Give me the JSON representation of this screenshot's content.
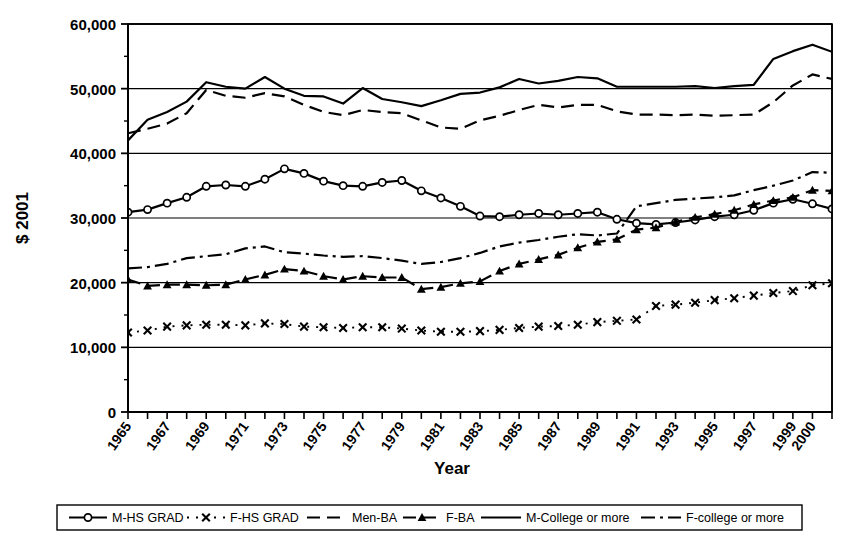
{
  "chart_data": {
    "type": "line",
    "title": "",
    "xlabel": "Year",
    "ylabel": "$ 2001",
    "ylim": [
      0,
      60000
    ],
    "xlim": [
      1965,
      2001
    ],
    "grid": true,
    "legend_position": "bottom",
    "ytick_labels": [
      "0",
      "10,000",
      "20,000",
      "30,000",
      "40,000",
      "50,000",
      "60,000"
    ],
    "ytick_values": [
      0,
      10000,
      20000,
      30000,
      40000,
      50000,
      60000
    ],
    "x": [
      1965,
      1966,
      1967,
      1968,
      1969,
      1970,
      1971,
      1972,
      1973,
      1974,
      1975,
      1976,
      1977,
      1978,
      1979,
      1980,
      1981,
      1982,
      1983,
      1984,
      1985,
      1986,
      1987,
      1988,
      1989,
      1990,
      1991,
      1992,
      1993,
      1994,
      1995,
      1996,
      1997,
      1998,
      1999,
      2000,
      2001
    ],
    "xtick_labels": [
      "1965",
      "",
      "1967",
      "",
      "1969",
      "",
      "1971",
      "",
      "1973",
      "",
      "1975",
      "",
      "1977",
      "",
      "1979",
      "",
      "1981",
      "",
      "1983",
      "",
      "1985",
      "",
      "1987",
      "",
      "1989",
      "",
      "1991",
      "",
      "1993",
      "",
      "1995",
      "",
      "1997",
      "",
      "1999",
      "2000",
      ""
    ],
    "series": [
      {
        "name": "M-HS GRAD",
        "marker": "circle-open",
        "dash": "solid",
        "values": [
          30900,
          31300,
          32300,
          33200,
          34900,
          35100,
          34900,
          36000,
          37600,
          36900,
          35700,
          35000,
          34900,
          35500,
          35800,
          34200,
          33100,
          31800,
          30300,
          30200,
          30500,
          30700,
          30500,
          30700,
          30900,
          29800,
          29200,
          29000,
          29300,
          29700,
          30200,
          30500,
          31200,
          32300,
          32900,
          32200,
          31400
        ]
      },
      {
        "name": "F-HS GRAD",
        "marker": "x",
        "dash": "dotted",
        "values": [
          12300,
          12600,
          13200,
          13400,
          13500,
          13500,
          13400,
          13700,
          13600,
          13200,
          13100,
          13000,
          13100,
          13100,
          12900,
          12600,
          12400,
          12400,
          12500,
          12700,
          13000,
          13200,
          13300,
          13500,
          13900,
          14100,
          14300,
          16400,
          16600,
          16900,
          17300,
          17600,
          18000,
          18400,
          18700,
          19600,
          19900
        ]
      },
      {
        "name": "Men-BA",
        "marker": "none",
        "dash": "dashed",
        "values": [
          43100,
          43800,
          44600,
          46200,
          49800,
          48900,
          48600,
          49300,
          48800,
          47500,
          46400,
          45900,
          46700,
          46400,
          46200,
          45100,
          44000,
          43800,
          45100,
          45800,
          46700,
          47500,
          47100,
          47500,
          47500,
          46500,
          46000,
          46000,
          45900,
          46000,
          45800,
          45900,
          46000,
          47900,
          50500,
          52200,
          51500
        ]
      },
      {
        "name": "F-BA",
        "marker": "triangle",
        "dash": "dashed",
        "values": [
          20500,
          19500,
          19700,
          19700,
          19600,
          19700,
          20500,
          21200,
          22100,
          21800,
          21000,
          20500,
          21000,
          20800,
          20800,
          19000,
          19300,
          19900,
          20200,
          21800,
          22900,
          23600,
          24300,
          25400,
          26300,
          26700,
          28200,
          28500,
          29400,
          30100,
          30600,
          31200,
          32100,
          32700,
          33200,
          34300,
          34200
        ]
      },
      {
        "name": "M-College or more",
        "marker": "none",
        "dash": "solid",
        "values": [
          42000,
          45200,
          46400,
          48000,
          51000,
          50300,
          50000,
          51800,
          50000,
          48900,
          48800,
          47700,
          50100,
          48400,
          47900,
          47300,
          48200,
          49200,
          49400,
          50200,
          51500,
          50800,
          51200,
          51800,
          51600,
          50300,
          50300,
          50300,
          50300,
          50400,
          50100,
          50400,
          50600,
          54600,
          55800,
          56800,
          55700
        ]
      },
      {
        "name": "F-college or more",
        "marker": "none",
        "dash": "dash-dot",
        "values": [
          22200,
          22400,
          22900,
          23800,
          24100,
          24400,
          25300,
          25600,
          24700,
          24500,
          24200,
          24000,
          24100,
          23800,
          23400,
          22900,
          23200,
          23800,
          24600,
          25600,
          26200,
          26600,
          27100,
          27500,
          27300,
          27600,
          31800,
          32300,
          32800,
          33000,
          33200,
          33500,
          34300,
          35000,
          35800,
          37100,
          37000
        ]
      }
    ]
  },
  "legend": {
    "items": [
      {
        "label": "M-HS GRAD"
      },
      {
        "label": "F-HS GRAD"
      },
      {
        "label": "Men-BA"
      },
      {
        "label": "F-BA"
      },
      {
        "label": "M-College or more"
      },
      {
        "label": "F-college or more"
      }
    ]
  }
}
